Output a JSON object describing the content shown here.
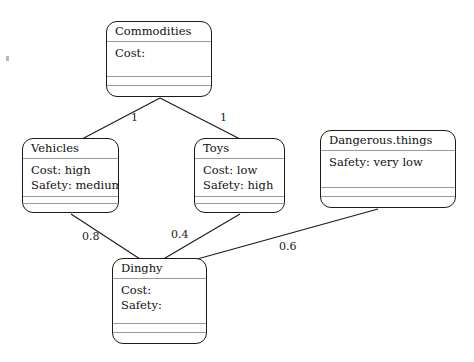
{
  "diagram": {
    "type": "uml-class-diagram",
    "line_color": "#1a1a1a",
    "divider_color": "#9a9a9a",
    "background": "#ffffff",
    "classes": [
      {
        "id": "commodities",
        "name": "Commodities",
        "attributes": [
          "Cost:"
        ],
        "x": 106,
        "y": 21,
        "w": 106,
        "h": 76
      },
      {
        "id": "vehicles",
        "name": "Vehicles",
        "attributes": [
          "Cost: high",
          "Safety: medium"
        ],
        "x": 22,
        "y": 138,
        "w": 97,
        "h": 75
      },
      {
        "id": "toys",
        "name": "Toys",
        "attributes": [
          "Cost: low",
          "Safety: high"
        ],
        "x": 194,
        "y": 138,
        "w": 91,
        "h": 75
      },
      {
        "id": "dangerous_things",
        "name": "Dangerous.things",
        "attributes": [
          "Safety: very low"
        ],
        "x": 320,
        "y": 130,
        "w": 136,
        "h": 78
      },
      {
        "id": "dinghy",
        "name": "Dinghy",
        "attributes": [
          "Cost:",
          "Safety:"
        ],
        "x": 112,
        "y": 258,
        "w": 95,
        "h": 86
      }
    ],
    "edges": [
      {
        "id": "commodities-vehicles",
        "from": "commodities",
        "to": "vehicles",
        "label": "1",
        "x1": 160,
        "y1": 98,
        "x2": 82,
        "y2": 139,
        "label_x": 131,
        "label_y": 111
      },
      {
        "id": "commodities-toys",
        "from": "commodities",
        "to": "toys",
        "label": "1",
        "x1": 160,
        "y1": 98,
        "x2": 240,
        "y2": 139,
        "label_x": 220,
        "label_y": 111
      },
      {
        "id": "vehicles-dinghy",
        "from": "vehicles",
        "to": "dinghy",
        "label": "0.8",
        "x1": 71,
        "y1": 214,
        "x2": 140,
        "y2": 259,
        "label_x": 82,
        "label_y": 230
      },
      {
        "id": "toys-dinghy",
        "from": "toys",
        "to": "dinghy",
        "label": "0.4",
        "x1": 240,
        "y1": 214,
        "x2": 160,
        "y2": 261,
        "label_x": 171,
        "label_y": 228
      },
      {
        "id": "dangerous-dinghy",
        "from": "dangerous_things",
        "to": "dinghy",
        "label": "0.6",
        "x1": 378,
        "y1": 209,
        "x2": 190,
        "y2": 261,
        "label_x": 279,
        "label_y": 240
      }
    ]
  }
}
